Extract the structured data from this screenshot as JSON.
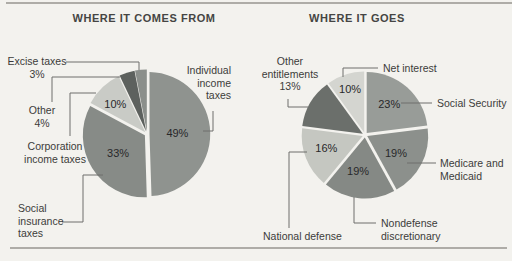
{
  "page": {
    "background": "#f3f2ee",
    "rule_color": "#aeaca7"
  },
  "chart_data": [
    {
      "type": "pie",
      "title": "WHERE IT COMES FROM",
      "units": "percent",
      "start_angle_deg": 0,
      "direction": "clockwise",
      "slices": [
        {
          "label": "Individual income taxes",
          "value": 49,
          "pct_text": "49%",
          "callout_lines": [
            "Individual",
            "income",
            "taxes"
          ],
          "color": "#8f938f"
        },
        {
          "label": "Social insurance taxes",
          "value": 33,
          "pct_text": "33%",
          "callout_lines": [
            "Social",
            "insurance",
            "taxes"
          ],
          "color": "#878b87"
        },
        {
          "label": "Corporation income taxes",
          "value": 10,
          "pct_text": "10%",
          "callout_lines": [
            "Corporation",
            "income taxes"
          ],
          "color": "#c9cbc6"
        },
        {
          "label": "Other",
          "value": 4,
          "callout_lines": [
            "Other",
            "4%"
          ],
          "color": "#5d615e"
        },
        {
          "label": "Excise taxes",
          "value": 3,
          "callout_lines": [
            "Excise taxes",
            "3%"
          ],
          "color": "#8b8f8b"
        }
      ]
    },
    {
      "type": "pie",
      "title": "WHERE IT GOES",
      "units": "percent",
      "start_angle_deg": 0,
      "direction": "clockwise",
      "slices": [
        {
          "label": "Social Security",
          "value": 23,
          "pct_text": "23%",
          "callout_lines": [
            "Social Security"
          ],
          "color": "#989c98"
        },
        {
          "label": "Medicare and Medicaid",
          "value": 19,
          "pct_text": "19%",
          "callout_lines": [
            "Medicare and",
            "Medicaid"
          ],
          "color": "#8c908c"
        },
        {
          "label": "Nondefense discretionary",
          "value": 19,
          "pct_text": "19%",
          "callout_lines": [
            "Nondefense",
            "discretionary"
          ],
          "color": "#858985"
        },
        {
          "label": "National defense",
          "value": 16,
          "pct_text": "16%",
          "callout_lines": [
            "National defense"
          ],
          "color": "#c5c7c1"
        },
        {
          "label": "Other entitlements",
          "value": 13,
          "callout_lines": [
            "Other",
            "entitlements",
            "13%"
          ],
          "color": "#6b6f6b"
        },
        {
          "label": "Net interest",
          "value": 10,
          "pct_text": "10%",
          "callout_lines": [
            "Net interest"
          ],
          "color": "#d4d5d0"
        }
      ]
    }
  ]
}
